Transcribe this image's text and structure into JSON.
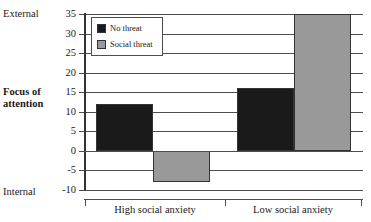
{
  "chart_data": {
    "type": "bar",
    "title": "",
    "subtitle": "",
    "xlabel": "",
    "ylabel": "Focus of attention",
    "ylim": [
      -10,
      35
    ],
    "ytick_interval": 5,
    "yticks": [
      35,
      30,
      25,
      20,
      15,
      10,
      5,
      0,
      -5,
      -10
    ],
    "ytick_labels": [
      "35",
      "30",
      "25",
      "20",
      "15",
      "10",
      "5",
      "0",
      "-5",
      "-10"
    ],
    "axis_pole_high": "External",
    "axis_pole_low": "Internal",
    "grid": true,
    "grid_axis": "y",
    "legend_position": "upper-left-inside",
    "categories": [
      "High social anxiety",
      "Low social anxiety"
    ],
    "series": [
      {
        "name": "No threat",
        "color": "#1a1a1a",
        "values": [
          12,
          16
        ]
      },
      {
        "name": "Social threat",
        "color": "#999999",
        "values": [
          -8,
          35
        ]
      }
    ]
  },
  "axis": {
    "pole_high_label": "External",
    "pole_low_label": "Internal",
    "vertical_axis_title_line1": "Focus of",
    "vertical_axis_title_line2": "attention"
  },
  "legend": {
    "items": [
      {
        "label": "No threat",
        "color": "#1a1a1a"
      },
      {
        "label": "Social threat",
        "color": "#999999"
      }
    ]
  },
  "colors": {
    "no_threat": "#1a1a1a",
    "social_threat": "#999999",
    "grid": "#4d4d4d",
    "axis": "#333333",
    "text": "#1a1a1a",
    "background": "#ffffff"
  }
}
